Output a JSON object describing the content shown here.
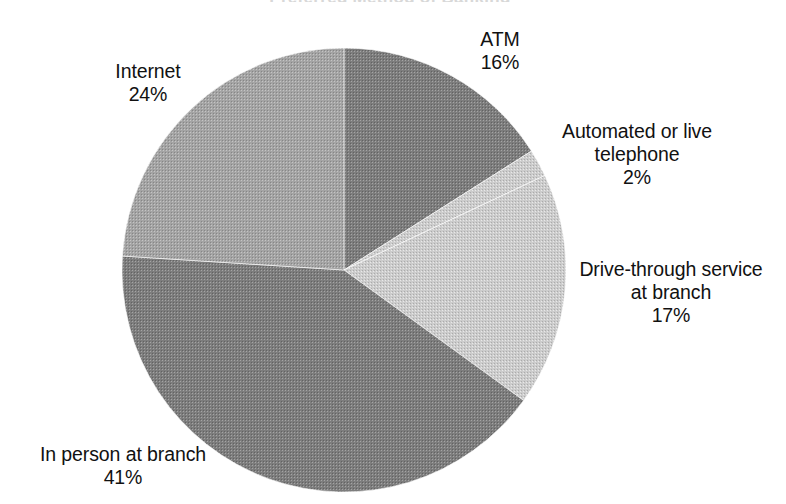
{
  "figure": {
    "title_remnant": "Preferred Method of Banking",
    "background_color": "#ffffff",
    "text_color": "#111111"
  },
  "chart_data": {
    "type": "pie",
    "title": "",
    "xlabel": "",
    "ylabel": "",
    "legend_position": "none",
    "grid": false,
    "start_angle_deg": 0,
    "direction": "clockwise",
    "center_px": [
      344,
      270
    ],
    "radius_px": 222,
    "categories": [
      "ATM",
      "Automated or live telephone",
      "Drive-through service at branch",
      "In person at branch",
      "Internet"
    ],
    "values": [
      16,
      2,
      17,
      41,
      24
    ],
    "value_unit": "%",
    "slices": [
      {
        "label": "ATM",
        "value": 16,
        "percent_text": "16%",
        "color": "#8b8b8b",
        "label_lines": [
          "ATM",
          "16%"
        ]
      },
      {
        "label": "Automated or live telephone",
        "value": 2,
        "percent_text": "2%",
        "color": "#c9c9c9",
        "label_lines": [
          "Automated or live",
          "telephone",
          "2%"
        ]
      },
      {
        "label": "Drive-through service at branch",
        "value": 17,
        "percent_text": "17%",
        "color": "#c9c9c9",
        "label_lines": [
          "Drive-through service",
          "at branch",
          "17%"
        ]
      },
      {
        "label": "In person at branch",
        "value": 41,
        "percent_text": "41%",
        "color": "#8a8a8a",
        "label_lines": [
          "In person at branch",
          "41%"
        ]
      },
      {
        "label": "Internet",
        "value": 24,
        "percent_text": "24%",
        "color": "#ababab",
        "label_lines": [
          "Internet",
          "24%"
        ]
      }
    ]
  },
  "labels": {
    "atm": "ATM\n16%",
    "telephone": "Automated or live\ntelephone\n2%",
    "drive_through": "Drive-through service\nat branch\n17%",
    "in_person": "In person at branch\n41%",
    "internet": "Internet\n24%"
  }
}
